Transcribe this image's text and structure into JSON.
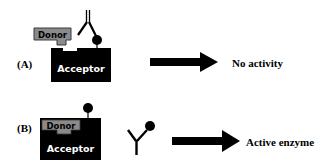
{
  "panels": [
    {
      "label": "(A)",
      "donor_label": "Donor",
      "acceptor_label": "Acceptor",
      "result": "No activity",
      "antibody_bound": true
    },
    {
      "label": "(B)",
      "donor_label": "Donor",
      "acceptor_label": "Acceptor",
      "result": "Active enzyme",
      "antibody_bound": false
    }
  ],
  "colors": {
    "acceptor": "#000000",
    "donor": "#8a8a8a",
    "donor_border": "#3a3a3a",
    "text_on_dark": "#ffffff",
    "ink": "#000000"
  }
}
